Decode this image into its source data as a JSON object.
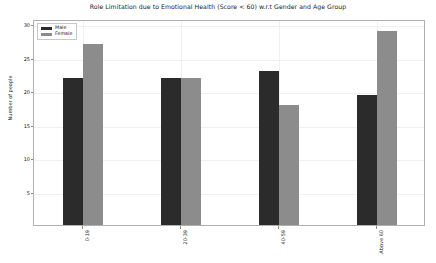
{
  "chart_data": {
    "type": "bar",
    "title": "Role Limitation due to Emotional Health (Score < 60) w.r.t Gender and Age Group",
    "xlabel": "",
    "ylabel": "Number of people",
    "categories": [
      "0-19",
      "20-39",
      "40-59",
      "Above 60"
    ],
    "series": [
      {
        "name": "Male",
        "color": "#2b2b2b",
        "values": [
          22,
          22,
          23,
          19.4
        ]
      },
      {
        "name": "Female",
        "color": "#8c8c8c",
        "values": [
          27,
          22,
          18,
          29
        ]
      }
    ],
    "ylim": [
      0,
      30.8
    ],
    "yticks": [
      5,
      10,
      15,
      20,
      25,
      30
    ],
    "ytick_labels": [
      "5",
      "10",
      "15",
      "20",
      "25",
      "30"
    ],
    "grid": true,
    "legend_position": "upper left"
  },
  "legend": {
    "items": [
      {
        "label": "Male",
        "color": "#2b2b2b"
      },
      {
        "label": "Female",
        "color": "#8c8c8c"
      }
    ]
  }
}
